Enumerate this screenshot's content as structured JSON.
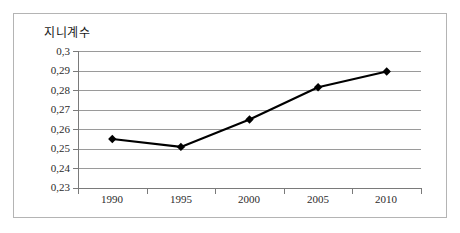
{
  "chart_data": {
    "type": "line",
    "title": "지니계수",
    "xlabel": "",
    "ylabel": "",
    "categories": [
      "1990",
      "1995",
      "2000",
      "2005",
      "2010"
    ],
    "values": [
      0.255,
      0.251,
      0.265,
      0.2815,
      0.2895
    ],
    "series": [
      {
        "name": "지니계수",
        "values": [
          0.255,
          0.251,
          0.265,
          0.2815,
          0.2895
        ]
      }
    ],
    "ylim": [
      0.23,
      0.3
    ],
    "ytick_labels": [
      "0,3",
      "0,29",
      "0,28",
      "0,27",
      "0,26",
      "0,25",
      "0,24",
      "0,23"
    ],
    "ytick_values": [
      0.3,
      0.29,
      0.28,
      0.27,
      0.26,
      0.25,
      0.24,
      0.23
    ],
    "grid": true,
    "legend": "none",
    "marker": "diamond",
    "line_color": "#000000",
    "marker_color": "#000000",
    "grid_color": "#9a9a9a",
    "axis_color": "#7a7a7a",
    "frame_color": "#b4b4b4",
    "background": "#ffffff"
  }
}
